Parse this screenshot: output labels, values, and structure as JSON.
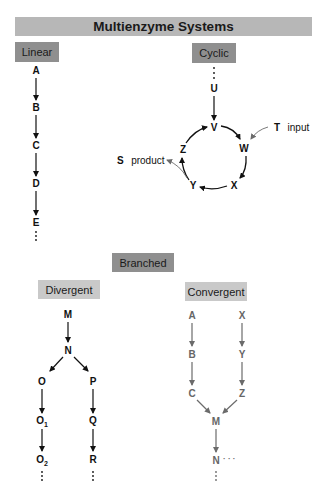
{
  "title": "Multienzyme Systems",
  "categories": {
    "linear": "Linear",
    "cyclic": "Cyclic",
    "branched": "Branched",
    "divergent": "Divergent",
    "convergent": "Convergent"
  },
  "linear": {
    "nodes": [
      "A",
      "B",
      "C",
      "D",
      "E"
    ]
  },
  "cyclic": {
    "entry": "U",
    "ring": [
      "V",
      "W",
      "X",
      "Y",
      "Z"
    ],
    "input": {
      "species": "T",
      "label": "input"
    },
    "output": {
      "species": "S",
      "label": "product"
    }
  },
  "divergent": {
    "root": "M",
    "branch_point": "N",
    "left": [
      "O",
      "O",
      "O"
    ],
    "left_subscripts": [
      "",
      "1",
      "2"
    ],
    "right": [
      "P",
      "Q",
      "R"
    ]
  },
  "convergent": {
    "left": [
      "A",
      "B",
      "C"
    ],
    "right": [
      "X",
      "Y",
      "Z"
    ],
    "merge": "M",
    "next": "N",
    "continuation": "· · ·"
  },
  "colors": {
    "title_bar": "#b7b7b7",
    "category_dark": "#8f8f8f",
    "category_light": "#c9c9c9",
    "arrow_dark": "#111111",
    "arrow_grey": "#6b6b6b"
  }
}
